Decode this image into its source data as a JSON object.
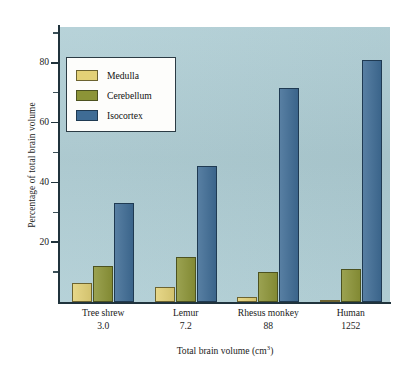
{
  "chart_data": {
    "type": "bar",
    "title": "",
    "subtitle": "",
    "xlabel": "Total brain volume (cm3)",
    "xlabel_base": "Total brain volume (cm",
    "xlabel_sup": "3",
    "xlabel_tail": ")",
    "ylabel": "Percentage of total brain volume",
    "categories": [
      "Tree shrew",
      "Lemur",
      "Rhesus monkey",
      "Human"
    ],
    "category_values": [
      "3.0",
      "7.2",
      "88",
      "1252"
    ],
    "series": [
      {
        "name": "Medulla",
        "color": "#e3d177",
        "values": [
          6.5,
          5.0,
          1.8,
          0.8
        ]
      },
      {
        "name": "Cerebellum",
        "color": "#8c9437",
        "values": [
          12.0,
          15.0,
          10.0,
          11.0
        ]
      },
      {
        "name": "Isocortex",
        "color": "#3f6c95",
        "values": [
          33.0,
          45.5,
          71.5,
          81.0
        ]
      }
    ],
    "ylim": [
      0,
      92
    ],
    "ytick_major": [
      20,
      40,
      60,
      80
    ],
    "ytick_major_labels": [
      "20",
      "40",
      "60",
      "80"
    ],
    "ytick_minor": [
      10,
      30,
      50,
      70,
      90
    ],
    "grid": false,
    "legend_position": "upper-left",
    "plot_background": "#aecdd4",
    "axis_color": "#20333c"
  },
  "legend": {
    "entries": [
      {
        "label": "Medulla",
        "color": "#e3d177"
      },
      {
        "label": "Cerebellum",
        "color": "#8c9437"
      },
      {
        "label": "Isocortex",
        "color": "#3f6c95"
      }
    ]
  }
}
